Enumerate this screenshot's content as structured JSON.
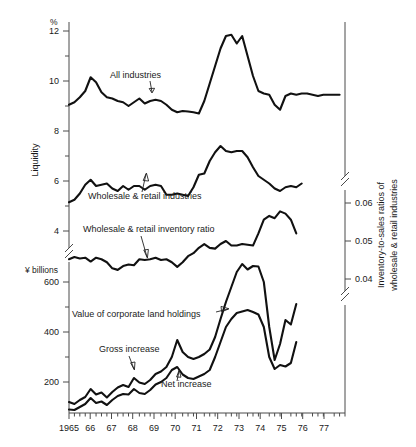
{
  "chart_data": {
    "type": "line",
    "title": "",
    "xlabel": "",
    "x_axis": {
      "tick_labels": [
        "1965",
        "66",
        "67",
        "68",
        "69",
        "70",
        "71",
        "72",
        "73",
        "74",
        "75",
        "76",
        "77"
      ],
      "range": [
        1965.0,
        1977.75
      ],
      "minor_ticks_per_year": 4
    },
    "left_axis_upper": {
      "label": "Liquidity",
      "unit": "%",
      "tick_labels": [
        "12",
        "10",
        "8",
        "6",
        "4"
      ],
      "tick_values": [
        12,
        10,
        8,
        6,
        4
      ]
    },
    "left_axis_lower": {
      "unit": "¥ billions",
      "tick_labels": [
        "600",
        "400",
        "200"
      ],
      "tick_values": [
        600,
        400,
        200
      ]
    },
    "right_axis": {
      "label": "Inventory-to-sales ratios of wholesale & retail industries",
      "tick_labels": [
        "0.06",
        "0.05",
        "0.04"
      ],
      "tick_values": [
        0.06,
        0.05,
        0.04
      ]
    },
    "axis_breaks": true,
    "grid": false,
    "legend_position": "inline-annotations",
    "series": [
      {
        "name": "All industries",
        "annotation": "All industries",
        "axis": "left-liquidity-percent",
        "x": [
          1965.0,
          1965.25,
          1965.5,
          1965.75,
          1966.0,
          1966.25,
          1966.5,
          1966.75,
          1967.0,
          1967.25,
          1967.5,
          1967.75,
          1968.0,
          1968.25,
          1968.5,
          1968.75,
          1969.0,
          1969.25,
          1969.5,
          1969.75,
          1970.0,
          1970.25,
          1970.5,
          1970.75,
          1971.0,
          1971.25,
          1971.5,
          1971.75,
          1972.0,
          1972.25,
          1972.5,
          1972.75,
          1973.0,
          1973.25,
          1973.5,
          1973.75,
          1974.0,
          1974.25,
          1974.5,
          1974.75,
          1975.0,
          1975.25,
          1975.5,
          1975.75,
          1976.0,
          1976.25,
          1976.5,
          1976.75,
          1977.0,
          1977.25,
          1977.5
        ],
        "values": [
          9.05,
          9.15,
          9.35,
          9.6,
          10.15,
          9.95,
          9.55,
          9.35,
          9.3,
          9.2,
          9.15,
          9.0,
          9.15,
          9.3,
          9.1,
          9.2,
          9.25,
          9.2,
          9.05,
          8.85,
          8.75,
          8.8,
          8.78,
          8.75,
          8.7,
          9.2,
          9.9,
          10.6,
          11.3,
          11.8,
          11.85,
          11.5,
          11.8,
          11.0,
          10.2,
          9.6,
          9.5,
          9.45,
          9.05,
          8.85,
          9.4,
          9.5,
          9.45,
          9.5,
          9.5,
          9.45,
          9.4,
          9.45,
          9.45,
          9.45,
          9.45
        ]
      },
      {
        "name": "Wholesale & retail industries",
        "annotation": "Wholesale & retail industries",
        "axis": "left-liquidity-percent",
        "x": [
          1965.0,
          1965.25,
          1965.5,
          1965.75,
          1966.0,
          1966.25,
          1966.5,
          1966.75,
          1967.0,
          1967.25,
          1967.5,
          1967.75,
          1968.0,
          1968.25,
          1968.5,
          1968.75,
          1969.0,
          1969.25,
          1969.5,
          1969.75,
          1970.0,
          1970.25,
          1970.5,
          1970.75,
          1971.0,
          1971.25,
          1971.5,
          1971.75,
          1972.0,
          1972.25,
          1972.5,
          1972.75,
          1973.0,
          1973.25,
          1973.5,
          1973.75,
          1974.0,
          1974.25,
          1974.5,
          1974.75,
          1975.0,
          1975.25,
          1975.5,
          1975.75
        ],
        "values": [
          5.15,
          5.25,
          5.5,
          5.85,
          6.05,
          5.8,
          5.85,
          5.9,
          5.7,
          5.6,
          5.8,
          5.65,
          5.8,
          5.8,
          5.65,
          5.8,
          5.85,
          5.8,
          5.45,
          5.45,
          5.5,
          5.45,
          5.4,
          5.75,
          6.25,
          6.3,
          6.8,
          7.15,
          7.4,
          7.2,
          7.15,
          7.2,
          7.2,
          6.95,
          6.55,
          6.2,
          6.05,
          5.9,
          5.7,
          5.6,
          5.75,
          5.8,
          5.75,
          5.9
        ]
      },
      {
        "name": "Wholesale & retail inventory ratio",
        "annotation": "Wholesale & retail inventory ratio",
        "axis": "right-inventory-ratio",
        "x": [
          1965.0,
          1965.25,
          1965.5,
          1965.75,
          1966.0,
          1966.25,
          1966.5,
          1966.75,
          1967.0,
          1967.25,
          1967.5,
          1967.75,
          1968.0,
          1968.25,
          1968.5,
          1968.75,
          1969.0,
          1969.25,
          1969.5,
          1969.75,
          1970.0,
          1970.25,
          1970.5,
          1970.75,
          1971.0,
          1971.25,
          1971.5,
          1971.75,
          1972.0,
          1972.25,
          1972.5,
          1972.75,
          1973.0,
          1973.25,
          1973.5,
          1973.75,
          1974.0,
          1974.25,
          1974.5,
          1974.75,
          1975.0,
          1975.25,
          1975.5
        ],
        "values": [
          0.0452,
          0.0458,
          0.0454,
          0.0456,
          0.0446,
          0.0456,
          0.0452,
          0.0444,
          0.0428,
          0.0424,
          0.0434,
          0.0438,
          0.0436,
          0.0452,
          0.045,
          0.0452,
          0.0456,
          0.045,
          0.0452,
          0.0444,
          0.0432,
          0.0444,
          0.046,
          0.0468,
          0.0482,
          0.0492,
          0.0482,
          0.048,
          0.0492,
          0.05,
          0.0488,
          0.0488,
          0.0492,
          0.049,
          0.0488,
          0.052,
          0.0556,
          0.0566,
          0.056,
          0.0578,
          0.0572,
          0.0556,
          0.052
        ]
      },
      {
        "name": "Value of corporate land holdings",
        "annotation": "Value of corporate land holdings",
        "axis": "left-yen-billions",
        "x": [
          1965.0,
          1965.25,
          1965.5,
          1965.75,
          1966.0,
          1966.25,
          1966.5,
          1966.75,
          1967.0,
          1967.25,
          1967.5,
          1967.75,
          1968.0,
          1968.25,
          1968.5,
          1968.75,
          1969.0,
          1969.25,
          1969.5,
          1969.75,
          1970.0,
          1970.25,
          1970.5,
          1970.75,
          1971.0,
          1971.25,
          1971.5,
          1971.75,
          1972.0,
          1972.25,
          1972.5,
          1972.75,
          1973.0,
          1973.25,
          1973.5,
          1973.75,
          1974.0,
          1974.25,
          1974.5,
          1974.75,
          1975.0,
          1975.25,
          1975.5
        ],
        "values": [
          120,
          112,
          128,
          140,
          172,
          150,
          158,
          138,
          160,
          178,
          188,
          180,
          216,
          198,
          192,
          208,
          232,
          242,
          260,
          300,
          368,
          320,
          300,
          292,
          300,
          312,
          330,
          380,
          452,
          520,
          580,
          640,
          672,
          650,
          664,
          662,
          600,
          420,
          288,
          352,
          448,
          430,
          512
        ]
      },
      {
        "name": "Gross increase",
        "annotation": "Gross increase",
        "axis": "left-yen-billions",
        "note": "label points to the lower of the two ¥ series at ~1968"
      },
      {
        "name": "Net increase",
        "annotation": "Net increase",
        "axis": "left-yen-billions",
        "x": [
          1965.0,
          1965.25,
          1965.5,
          1965.75,
          1966.0,
          1966.25,
          1966.5,
          1966.75,
          1967.0,
          1967.25,
          1967.5,
          1967.75,
          1968.0,
          1968.25,
          1968.5,
          1968.75,
          1969.0,
          1969.25,
          1969.5,
          1969.75,
          1970.0,
          1970.25,
          1970.5,
          1970.75,
          1971.0,
          1971.25,
          1971.5,
          1971.75,
          1972.0,
          1972.25,
          1972.5,
          1972.75,
          1973.0,
          1973.25,
          1973.5,
          1973.75,
          1974.0,
          1974.25,
          1974.5,
          1974.75,
          1975.0,
          1975.25,
          1975.5
        ],
        "values": [
          90,
          88,
          100,
          112,
          136,
          116,
          122,
          108,
          128,
          144,
          152,
          150,
          172,
          156,
          152,
          168,
          190,
          200,
          216,
          248,
          260,
          230,
          216,
          212,
          222,
          232,
          248,
          300,
          360,
          420,
          452,
          476,
          482,
          488,
          480,
          470,
          420,
          300,
          252,
          268,
          262,
          276,
          360
        ]
      }
    ]
  },
  "annotations": {
    "all_industries": "All industries",
    "wholesale_retail_industries": "Wholesale & retail industries",
    "wholesale_retail_inventory_ratio": "Wholesale & retail inventory ratio",
    "value_corporate_land": "Value of corporate land holdings",
    "gross_increase": "Gross increase",
    "net_increase": "Net increase"
  },
  "axes": {
    "left_unit_percent": "%",
    "left_unit_yen": "¥ billions",
    "left_title": "Liquidity",
    "right_title_line1": "Inventory-to-sales ratios of",
    "right_title_line2": "wholesale & retail industries",
    "left_ticks": [
      "12",
      "10",
      "8",
      "6",
      "4",
      "600",
      "400",
      "200"
    ],
    "right_ticks": [
      "0.06",
      "0.05",
      "0.04"
    ],
    "x_ticks": [
      "1965",
      "66",
      "67",
      "68",
      "69",
      "70",
      "71",
      "72",
      "73",
      "74",
      "75",
      "76",
      "77"
    ]
  },
  "colors": {
    "curve": "#111111",
    "axis": "#4a4a4a",
    "text": "#1a1a1a",
    "background": "#ffffff"
  }
}
